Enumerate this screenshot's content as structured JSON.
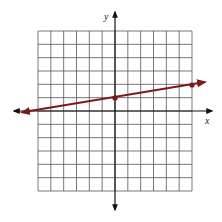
{
  "chart_data": {
    "type": "line",
    "title": "",
    "xlabel": "x",
    "ylabel": "y",
    "xlim": [
      -6,
      6
    ],
    "ylim": [
      -6,
      6
    ],
    "grid": true,
    "grid_step": 1,
    "series": [
      {
        "name": "line",
        "equation": "y = (1/6)x + 1",
        "slope": 0.1667,
        "intercept": 1,
        "color": "#7a1a1a",
        "marked_points": [
          [
            0,
            1
          ],
          [
            6,
            2
          ]
        ],
        "arrows_both_ends": true
      }
    ]
  },
  "labels": {
    "x_axis": "x",
    "y_axis": "y"
  },
  "colors": {
    "grid": "#555555",
    "axis": "#111111",
    "line": "#7a1a1a"
  }
}
